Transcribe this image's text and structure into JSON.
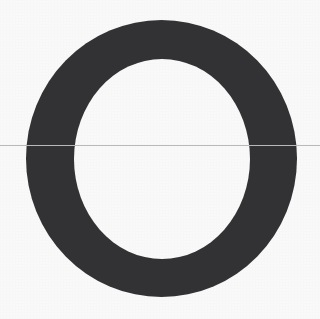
{
  "image": {
    "kind": "letterform-specimen",
    "glyph_character": "O",
    "glyph_description": "uppercase letter O",
    "width": 320,
    "height": 319,
    "background_color": "#fefefe"
  },
  "glyph": {
    "label": "O",
    "fill_color": "#333335",
    "outer": {
      "cx": 161.5,
      "cy": 158.5,
      "rx": 135.5,
      "ry": 138.5
    },
    "inner": {
      "cx": 162.0,
      "cy": 159.0,
      "rx": 88.0,
      "ry": 100.0
    },
    "stroke_width_horizontal": 47,
    "stroke_width_vertical": 39,
    "bounds": {
      "left": 26,
      "top": 20,
      "right": 297,
      "bottom": 297
    },
    "counter_bounds": {
      "left": 74,
      "top": 59,
      "right": 250,
      "bottom": 259
    },
    "texture": "paper-scan-grain"
  },
  "baseline": {
    "name": "horizontal-guide-line",
    "y": 145,
    "color": "#b9b9b9",
    "thickness": 1,
    "x_start": 0,
    "x_end": 320,
    "spans_full_width": true
  }
}
